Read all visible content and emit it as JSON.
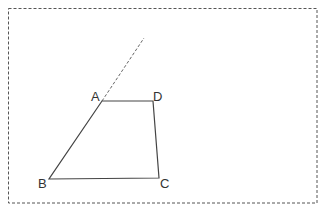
{
  "diagram": {
    "type": "geometry-figure",
    "frame": {
      "style": "dashed",
      "color": "#555555"
    },
    "points": [
      {
        "label": "A",
        "x": 102,
        "y": 101
      },
      {
        "label": "D",
        "x": 153,
        "y": 101
      },
      {
        "label": "C",
        "x": 159,
        "y": 178
      },
      {
        "label": "B",
        "x": 49,
        "y": 179
      }
    ],
    "labels": {
      "a": "A",
      "b": "B",
      "c": "C",
      "d": "D"
    },
    "segments": [
      "AD",
      "DC",
      "CB",
      "BA"
    ],
    "extension": {
      "from": "A",
      "direction": "extension of BA",
      "style": "dashed"
    },
    "colors": {
      "line": "#444444",
      "dashed": "#666666"
    }
  }
}
